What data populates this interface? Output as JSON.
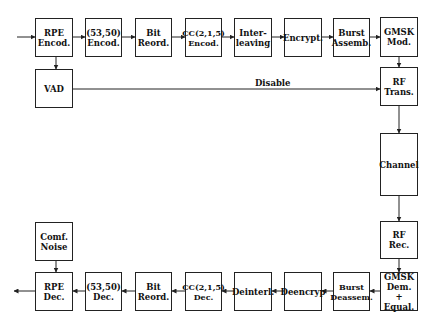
{
  "transmitter": [
    {
      "id": "rpe-encod",
      "label": "RPE\nEncod."
    },
    {
      "id": "53-50-encod",
      "label": "(53,50)\nEncod."
    },
    {
      "id": "bit-reord-tx",
      "label": "Bit\nReord."
    },
    {
      "id": "cc-encod",
      "label": "CC(2,1,5)\nEncod."
    },
    {
      "id": "interleaving",
      "label": "Inter-\nleaving"
    },
    {
      "id": "encrypt",
      "label": "Encrypt."
    },
    {
      "id": "burst-assemb",
      "label": "Burst\nAssemb."
    },
    {
      "id": "gmsk-mod",
      "label": "GMSK\nMod."
    }
  ],
  "vad": {
    "label": "VAD"
  },
  "rf_trans": {
    "label": "RF\nTrans."
  },
  "channel": {
    "label": "Channel"
  },
  "rf_rec": {
    "label": "RF\nRec."
  },
  "disable_label": "Disable",
  "comf_noise": {
    "label": "Comf.\nNoise"
  },
  "receiver": [
    {
      "id": "rpe-dec",
      "label": "RPE\nDec."
    },
    {
      "id": "53-50-dec",
      "label": "(53,50)\nDec."
    },
    {
      "id": "bit-reord-rx",
      "label": "Bit\nReord."
    },
    {
      "id": "cc-dec",
      "label": "CC(2,1,5)\nDec."
    },
    {
      "id": "deinterl",
      "label": "Deinterl."
    },
    {
      "id": "deencryp",
      "label": "Deencryp"
    },
    {
      "id": "burst-deassem",
      "label": "Burst\nDeassem."
    },
    {
      "id": "gmsk-dem",
      "label": "GMSK\nDem.\n+ Equal."
    }
  ]
}
